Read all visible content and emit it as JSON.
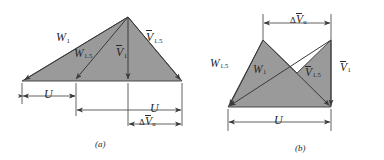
{
  "figure": {
    "background": "#ffffff",
    "fill_color": "#9a9a9a",
    "line_color": "#3a3a3a",
    "panels": [
      {
        "id": "a",
        "caption": "(a)",
        "vectors": [
          {
            "name": "W1",
            "symbol": "W",
            "subscript": "1",
            "overbar": false
          },
          {
            "name": "W15",
            "symbol": "W",
            "subscript": "1.5",
            "overbar": false
          },
          {
            "name": "V1",
            "symbol": "V",
            "subscript": "1",
            "overbar": true
          },
          {
            "name": "V15",
            "symbol": "V",
            "subscript": "1.5",
            "overbar": true
          }
        ],
        "dimensions": [
          {
            "name": "U-left",
            "symbol": "U",
            "subscript": "",
            "overbar": false,
            "delta": false
          },
          {
            "name": "U-right",
            "symbol": "U",
            "subscript": "",
            "overbar": false,
            "delta": false
          },
          {
            "name": "dVu",
            "symbol": "V",
            "subscript": "u",
            "overbar": true,
            "delta": true
          }
        ]
      },
      {
        "id": "b",
        "caption": "(b)",
        "vectors": [
          {
            "name": "W15",
            "symbol": "W",
            "subscript": "1.5",
            "overbar": false
          },
          {
            "name": "W1",
            "symbol": "W",
            "subscript": "1",
            "overbar": false
          },
          {
            "name": "V15",
            "symbol": "V",
            "subscript": "1.5",
            "overbar": true
          },
          {
            "name": "V1",
            "symbol": "V",
            "subscript": "1",
            "overbar": true
          }
        ],
        "dimensions": [
          {
            "name": "dVu",
            "symbol": "V",
            "subscript": "u",
            "overbar": true,
            "delta": true
          },
          {
            "name": "U",
            "symbol": "U",
            "subscript": "",
            "overbar": false,
            "delta": false
          }
        ]
      }
    ],
    "labels": {
      "a_W1": "W",
      "a_W1_sub": "1",
      "a_W15": "W",
      "a_W15_sub": "1.5",
      "a_V1": "V",
      "a_V1_sub": "1",
      "a_V15": "V",
      "a_V15_sub": "1.5",
      "a_U_left": "U",
      "a_U_right": "U",
      "a_dV_delta": "Δ",
      "a_dV": "V",
      "a_dV_sub": "u",
      "a_caption": "(a)",
      "b_W15": "W",
      "b_W15_sub": "1.5",
      "b_W1": "W",
      "b_W1_sub": "1",
      "b_V15": "V",
      "b_V15_sub": "1.5",
      "b_V1": "V",
      "b_V1_sub": "1",
      "b_dV_delta": "Δ",
      "b_dV": "V",
      "b_dV_sub": "u",
      "b_U": "U",
      "b_caption": "(b)"
    }
  }
}
